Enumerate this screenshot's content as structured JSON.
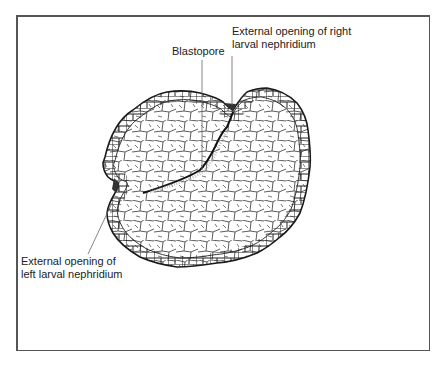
{
  "figure": {
    "labels": {
      "right_nephridium": {
        "line1": "External opening of right",
        "line2": "larval nephridium"
      },
      "blastopore": "Blastopore",
      "left_nephridium": {
        "line1": "External opening of",
        "line2": "left larval nephridium"
      }
    },
    "colors": {
      "frame": "#555555",
      "outline": "#1a1a1a",
      "text": "#222222",
      "leader": "#666666"
    }
  }
}
